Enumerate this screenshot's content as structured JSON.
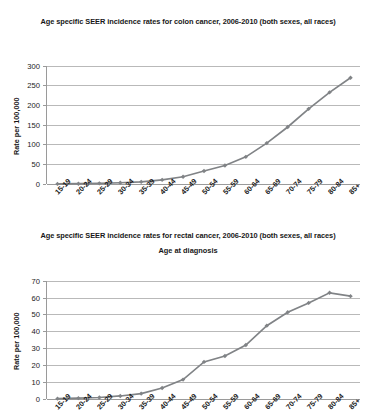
{
  "page": {
    "background": "#ffffff",
    "series_color": "#808386",
    "grid_color": "#b9b9b9",
    "axis_color": "#9a9a9a"
  },
  "charts": [
    {
      "id": "colon",
      "title": "Age specific SEER incidence rates for colon cancer, 2006-2010 (both sexes, all races)",
      "ylabel": "Rate per 100,000",
      "xlabel": "Age at diagnosis",
      "yticks": [
        "0",
        "50",
        "100",
        "150",
        "200",
        "250",
        "300"
      ],
      "xticks": [
        "15-19",
        "20-24",
        "25-29",
        "30-34",
        "35-39",
        "40-44",
        "45-49",
        "50-54",
        "55-59",
        "60-64",
        "65-69",
        "70-74",
        "75-79",
        "80-84",
        "85+"
      ]
    },
    {
      "id": "rectal",
      "title": "Age specific SEER incidence rates for rectal cancer, 2006-2010 (both sexes, all races)",
      "ylabel": "Rate per 100,000",
      "xlabel": "",
      "yticks": [
        "0",
        "10",
        "20",
        "30",
        "40",
        "50",
        "60",
        "70"
      ],
      "xticks": [
        "15-19",
        "20-24",
        "25-29",
        "30-34",
        "35-39",
        "40-44",
        "45-49",
        "50-54",
        "55-59",
        "60-64",
        "65-69",
        "70-74",
        "75-79",
        "80-84",
        "85+"
      ]
    }
  ],
  "chart_data": [
    {
      "type": "line",
      "title": "Age specific SEER incidence rates for colon cancer, 2006-2010 (both sexes, all races)",
      "xlabel": "Age at diagnosis",
      "ylabel": "Rate per 100,000",
      "categories": [
        "15-19",
        "20-24",
        "25-29",
        "30-34",
        "35-39",
        "40-44",
        "45-49",
        "50-54",
        "55-59",
        "60-64",
        "65-69",
        "70-74",
        "75-79",
        "80-84",
        "85+"
      ],
      "values": [
        0.3,
        0.8,
        1.6,
        3.2,
        5.5,
        10.5,
        18.5,
        33,
        47,
        69,
        104,
        145,
        191,
        233,
        270
      ],
      "ylim": [
        0,
        300
      ],
      "ytick_step": 50,
      "grid": "horizontal",
      "legend": "none",
      "marker": "diamond",
      "series_color": "#808386"
    },
    {
      "type": "line",
      "title": "Age specific SEER incidence rates for rectal cancer, 2006-2010 (both sexes, all races)",
      "xlabel": "",
      "ylabel": "Rate per 100,000",
      "categories": [
        "15-19",
        "20-24",
        "25-29",
        "30-34",
        "35-39",
        "40-44",
        "45-49",
        "50-54",
        "55-59",
        "60-64",
        "65-69",
        "70-74",
        "75-79",
        "80-84",
        "85+"
      ],
      "values": [
        0.2,
        0.5,
        0.9,
        1.8,
        3.2,
        6.5,
        11.5,
        22,
        25.5,
        32,
        43.5,
        51.5,
        57,
        63,
        61
      ],
      "ylim": [
        0,
        70
      ],
      "ytick_step": 10,
      "grid": "horizontal",
      "legend": "none",
      "marker": "diamond",
      "series_color": "#808386"
    }
  ]
}
